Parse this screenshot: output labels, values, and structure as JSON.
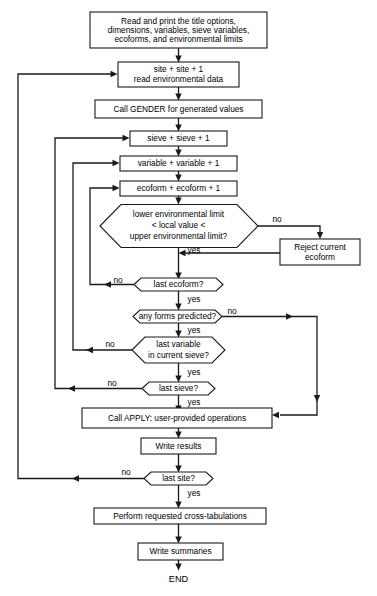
{
  "diagram": {
    "nodes": {
      "read_print": {
        "lines": [
          "Read and print the title options,",
          "dimensions, variables, sieve variables,",
          "ecoforms, and environmental limits"
        ],
        "shape": "process"
      },
      "site_increment": {
        "lines": [
          "site + site + 1",
          "read environmental data"
        ],
        "shape": "process"
      },
      "call_gender": {
        "lines": [
          "Call GENDER for generated values"
        ],
        "shape": "process"
      },
      "sieve_increment": {
        "lines": [
          "sieve + sieve + 1"
        ],
        "shape": "process"
      },
      "variable_increment": {
        "lines": [
          "variable + variable + 1"
        ],
        "shape": "process"
      },
      "ecoform_increment": {
        "lines": [
          "ecoform + ecoform + 1"
        ],
        "shape": "process"
      },
      "env_limit_check": {
        "lines": [
          "lower environmental limit",
          "< local value <",
          "upper environmental limit?"
        ],
        "shape": "decision"
      },
      "reject_ecoform": {
        "lines": [
          "Reject current",
          "ecoform"
        ],
        "shape": "process"
      },
      "last_ecoform": {
        "lines": [
          "last ecoform?"
        ],
        "shape": "decision"
      },
      "any_forms_predicted": {
        "lines": [
          "any forms predicted?"
        ],
        "shape": "decision"
      },
      "last_variable": {
        "lines": [
          "last variable",
          "in current sieve?"
        ],
        "shape": "decision"
      },
      "last_sieve": {
        "lines": [
          "last sieve?"
        ],
        "shape": "decision"
      },
      "call_apply": {
        "lines": [
          "Call APPLY: user-provided operations"
        ],
        "shape": "process"
      },
      "write_results": {
        "lines": [
          "Write results"
        ],
        "shape": "process"
      },
      "last_site": {
        "lines": [
          "last site?"
        ],
        "shape": "decision"
      },
      "cross_tabulations": {
        "lines": [
          "Perform requested cross-tabulations"
        ],
        "shape": "process"
      },
      "write_summaries": {
        "lines": [
          "Write summaries"
        ],
        "shape": "process"
      },
      "end": {
        "lines": [
          "END"
        ],
        "shape": "terminal"
      }
    },
    "edge_labels": {
      "env_limit_no": "no",
      "env_limit_yes": "yes",
      "last_ecoform_no": "no",
      "last_ecoform_yes": "yes",
      "any_forms_no": "no",
      "any_forms_yes": "yes",
      "last_variable_no": "no",
      "last_variable_yes": "yes",
      "last_sieve_no": "no",
      "last_sieve_yes": "yes",
      "last_site_no": "no",
      "last_site_yes": "yes"
    },
    "colors": {
      "stroke": "#1a1a1a",
      "fill": "#ffffff",
      "text": "#000000"
    }
  }
}
